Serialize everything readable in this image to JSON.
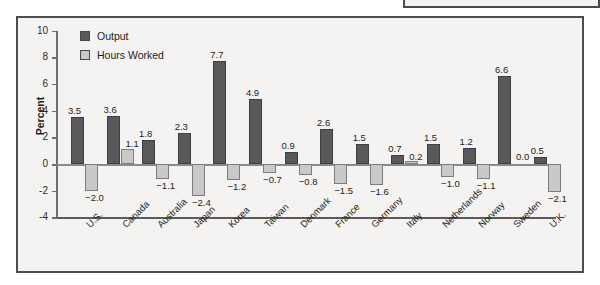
{
  "figure": {
    "ylabel": "Percent",
    "legend": [
      {
        "name": "output",
        "label": "Output",
        "color": "#59595b"
      },
      {
        "name": "hours-worked",
        "label": "Hours Worked",
        "color": "#c9c9c9"
      }
    ],
    "yticks": [
      "10",
      "8",
      "6",
      "4",
      "2",
      "0",
      "-2",
      "-4"
    ]
  },
  "chart_data": {
    "type": "bar",
    "title": "",
    "xlabel": "",
    "ylabel": "Percent",
    "ylim": [
      -4,
      10
    ],
    "ytick_values": [
      10,
      8,
      6,
      4,
      2,
      0,
      -2,
      -4
    ],
    "grid": false,
    "legend_position": "top-left",
    "categories": [
      "U.S.",
      "Canada",
      "Australia",
      "Japan",
      "Korea",
      "Taiwan",
      "Denmark",
      "France",
      "Germany",
      "Italy",
      "Netherlands",
      "Norway",
      "Sweden",
      "U.K."
    ],
    "series": [
      {
        "name": "Output",
        "color": "#59595b",
        "values": [
          3.5,
          3.6,
          1.8,
          2.3,
          7.7,
          4.9,
          0.9,
          2.6,
          1.5,
          0.7,
          1.5,
          1.2,
          6.6,
          0.5
        ],
        "labels": [
          "3.5",
          "3.6",
          "1.8",
          "2.3",
          "7.7",
          "4.9",
          "0.9",
          "2.6",
          "1.5",
          "0.7",
          "1.5",
          "1.2",
          "6.6",
          "0.5"
        ]
      },
      {
        "name": "Hours Worked",
        "color": "#c9c9c9",
        "values": [
          -2.0,
          1.1,
          -1.1,
          -2.4,
          -1.2,
          -0.7,
          -0.8,
          -1.5,
          -1.6,
          0.2,
          -1.0,
          -1.1,
          0.0,
          -2.1
        ],
        "labels": [
          "-2.0",
          "1.1",
          "-1.1",
          "-2.4",
          "-1.2",
          "-0.7",
          "-0.8",
          "-1.5",
          "-1.6",
          "0.2",
          "-1.0",
          "-1.1",
          "0.0",
          "-2.1"
        ]
      }
    ]
  }
}
